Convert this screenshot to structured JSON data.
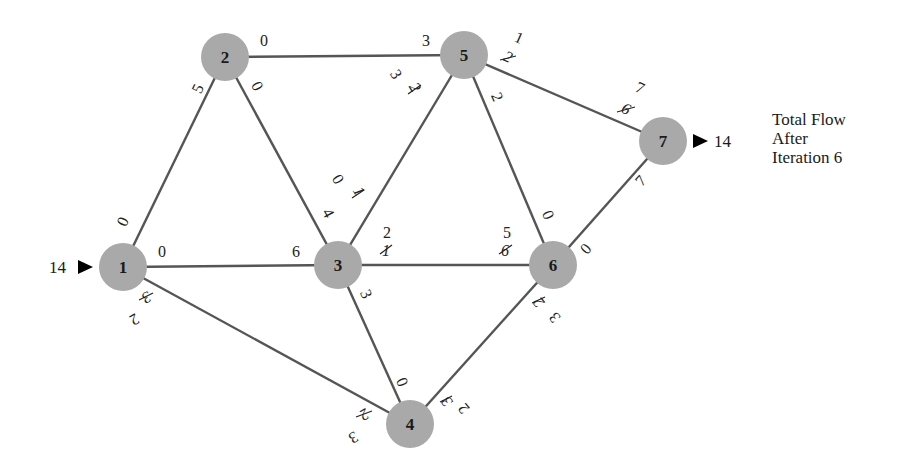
{
  "diagram": {
    "type": "network-flow",
    "caption": {
      "line1": "Total Flow",
      "line2": "After",
      "line3": "Iteration 6"
    },
    "source": {
      "node": "1",
      "inflow": "14"
    },
    "sink": {
      "node": "7",
      "outflow": "14"
    },
    "nodes": [
      {
        "id": "1",
        "label": "1",
        "x": 123,
        "y": 267
      },
      {
        "id": "2",
        "label": "2",
        "x": 225,
        "y": 57
      },
      {
        "id": "3",
        "label": "3",
        "x": 338,
        "y": 265
      },
      {
        "id": "4",
        "label": "4",
        "x": 410,
        "y": 424
      },
      {
        "id": "5",
        "label": "5",
        "x": 464,
        "y": 55
      },
      {
        "id": "6",
        "label": "6",
        "x": 553,
        "y": 265
      },
      {
        "id": "7",
        "label": "7",
        "x": 663,
        "y": 141
      }
    ],
    "edges": [
      {
        "from": "1",
        "to": "2",
        "cap_at_from": "0",
        "cap_at_to": "5"
      },
      {
        "from": "2",
        "to": "5",
        "cap_at_from": "0",
        "cap_at_to": "3"
      },
      {
        "from": "2",
        "to": "3",
        "cap_at_from": "0",
        "cap_at_to": "4"
      },
      {
        "from": "1",
        "to": "3",
        "cap_at_from": "0",
        "cap_at_to": "6"
      },
      {
        "from": "3",
        "to": "5",
        "cap_at_from": "0",
        "cap_at_from_old": "1",
        "cap_at_to": "3",
        "cap_at_to_old": "2"
      },
      {
        "from": "5",
        "to": "7",
        "cap_at_from": "1",
        "cap_at_from_old": "2",
        "cap_at_to": "7",
        "cap_at_to_old": "6"
      },
      {
        "from": "5",
        "to": "6",
        "cap_at_from": "2",
        "cap_at_to": "0"
      },
      {
        "from": "3",
        "to": "6",
        "cap_at_from": "2",
        "cap_at_from_old": "1",
        "cap_at_to": "5",
        "cap_at_to_old": "6"
      },
      {
        "from": "6",
        "to": "7",
        "cap_at_from": "0",
        "cap_at_to": "7"
      },
      {
        "from": "1",
        "to": "4",
        "cap_at_from": "2",
        "cap_at_from_old": "3",
        "cap_at_to": "3",
        "cap_at_to_old": "2"
      },
      {
        "from": "3",
        "to": "4",
        "cap_at_from": "3",
        "cap_at_to": "0"
      },
      {
        "from": "4",
        "to": "6",
        "cap_at_from": "2",
        "cap_at_from_old": "3",
        "cap_at_to": "3",
        "cap_at_to_old": "2"
      }
    ]
  }
}
